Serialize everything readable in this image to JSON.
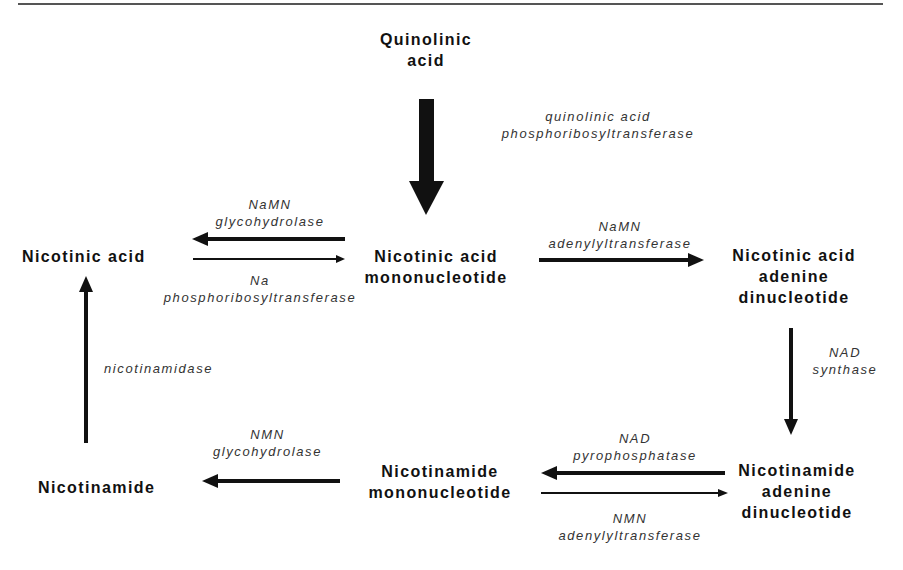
{
  "nodes": {
    "quinolinic_acid": [
      "Quinolinic",
      "acid"
    ],
    "nicotinic_acid": "Nicotinic acid",
    "namn": [
      "Nicotinic acid",
      "mononucleotide"
    ],
    "naad": [
      "Nicotinic acid",
      "adenine",
      "dinucleotide"
    ],
    "nad": [
      "Nicotinamide",
      "adenine",
      "dinucleotide"
    ],
    "nmn": [
      "Nicotinamide",
      "mononucleotide"
    ],
    "nicotinamide": "Nicotinamide"
  },
  "enzymes": {
    "qaprt": [
      "quinolinic acid",
      "phosphoribosyltransferase"
    ],
    "namn_glycohydrolase": [
      "NaMN",
      "glycohydrolase"
    ],
    "na_prt": [
      "Na",
      "phosphoribosyltransferase"
    ],
    "namn_adenylyltransferase": [
      "NaMN",
      "adenylyltransferase"
    ],
    "nad_synthase": [
      "NAD",
      "synthase"
    ],
    "nad_pyrophosphatase": [
      "NAD",
      "pyrophosphatase"
    ],
    "nmn_adenylyltransferase": [
      "NMN",
      "adenylyltransferase"
    ],
    "nmn_glycohydrolase": [
      "NMN",
      "glycohydrolase"
    ],
    "nicotinamidase": "nicotinamidase"
  },
  "edges": [
    {
      "from": "Quinolinic acid",
      "to": "Nicotinic acid mononucleotide",
      "enzyme": "quinolinic acid phosphoribosyltransferase",
      "weight": "major"
    },
    {
      "from": "Nicotinic acid mononucleotide",
      "to": "Nicotinic acid",
      "enzyme": "NaMN glycohydrolase",
      "weight": "medium"
    },
    {
      "from": "Nicotinic acid",
      "to": "Nicotinic acid mononucleotide",
      "enzyme": "Na phosphoribosyltransferase",
      "weight": "minor"
    },
    {
      "from": "Nicotinic acid mononucleotide",
      "to": "Nicotinic acid adenine dinucleotide",
      "enzyme": "NaMN adenylyltransferase",
      "weight": "medium"
    },
    {
      "from": "Nicotinic acid adenine dinucleotide",
      "to": "Nicotinamide adenine dinucleotide",
      "enzyme": "NAD synthase",
      "weight": "medium"
    },
    {
      "from": "Nicotinamide adenine dinucleotide",
      "to": "Nicotinamide mononucleotide",
      "enzyme": "NAD pyrophosphatase",
      "weight": "medium"
    },
    {
      "from": "Nicotinamide mononucleotide",
      "to": "Nicotinamide adenine dinucleotide",
      "enzyme": "NMN adenylyltransferase",
      "weight": "minor"
    },
    {
      "from": "Nicotinamide mononucleotide",
      "to": "Nicotinamide",
      "enzyme": "NMN glycohydrolase",
      "weight": "medium"
    },
    {
      "from": "Nicotinamide",
      "to": "Nicotinic acid",
      "enzyme": "nicotinamidase",
      "weight": "medium"
    }
  ],
  "colors": {
    "ink": "#111111",
    "enzyme_text": "#333333",
    "rule": "#555555",
    "background": "#ffffff"
  }
}
